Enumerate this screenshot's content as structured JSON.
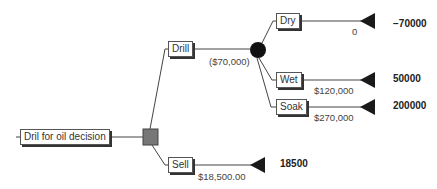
{
  "tree": {
    "root": {
      "label": "Dril for oil decision",
      "node_type": "decision"
    },
    "branches": {
      "drill": {
        "label": "Drill",
        "value": "($70,000)",
        "node_type": "chance",
        "outcomes": {
          "dry": {
            "label": "Dry",
            "value": "0",
            "payoff": "−70000"
          },
          "wet": {
            "label": "Wet",
            "value": "$120,000",
            "payoff": "50000"
          },
          "soak": {
            "label": "Soak",
            "value": "$270,000",
            "payoff": "200000"
          }
        }
      },
      "sell": {
        "label": "Sell",
        "value": "$18,500.00",
        "payoff": "18500"
      }
    }
  },
  "colors": {
    "line": "#444444",
    "decision_node": "#777777",
    "chance_node": "#111111",
    "terminal_node": "#1a1a1a"
  }
}
